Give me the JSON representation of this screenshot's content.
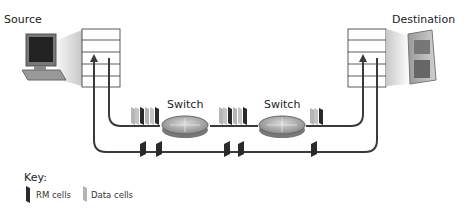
{
  "labels": {
    "source": "Source",
    "destination": "Destination",
    "switch_1": "Switch",
    "switch_2": "Switch"
  },
  "key": {
    "title": "Key:",
    "rm_cells": "RM cells",
    "data_cells": "Data cells"
  },
  "colors": {
    "rm_cell": "#2a2a2a",
    "data_cell": "#b5b5b5",
    "line": "#3a3a3a",
    "switch": "#a8a8a8"
  },
  "icons": {
    "source_device": "desktop-computer-icon",
    "destination_device": "tower-server-icon",
    "switch": "router-switch-icon"
  }
}
